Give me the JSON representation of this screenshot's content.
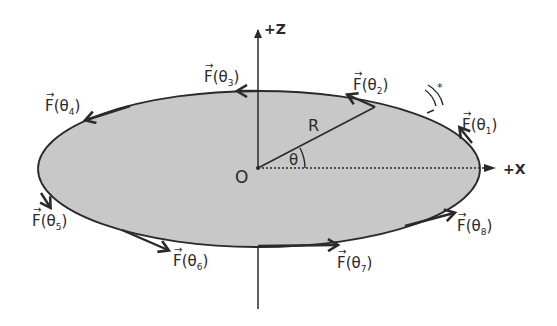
{
  "figure": {
    "colors": {
      "disk_fill": "#c8c8c8",
      "stroke": "#2a2a2a",
      "background": "#ffffff"
    },
    "axes": {
      "z_label": "+Z",
      "x_label": "+X"
    },
    "origin_label": "O",
    "radius_label": "R",
    "angle_label": "θ",
    "rotation_indicator": "ω",
    "force_labels": [
      {
        "id": "theta1",
        "vec": "F",
        "open": "(θ",
        "sub": "1",
        "close": ")"
      },
      {
        "id": "theta2",
        "vec": "F",
        "open": "(θ",
        "sub": "2",
        "close": ")"
      },
      {
        "id": "theta3",
        "vec": "F",
        "open": "(θ",
        "sub": "3",
        "close": ")"
      },
      {
        "id": "theta4",
        "vec": "F",
        "open": "(θ",
        "sub": "4",
        "close": ")"
      },
      {
        "id": "theta5",
        "vec": "F",
        "open": "(θ",
        "sub": "5",
        "close": ")"
      },
      {
        "id": "theta6",
        "vec": "F",
        "open": "(θ",
        "sub": "6",
        "close": ")"
      },
      {
        "id": "theta7",
        "vec": "F",
        "open": "(θ",
        "sub": "7",
        "close": ")"
      },
      {
        "id": "theta8",
        "vec": "F",
        "open": "(θ",
        "sub": "8",
        "close": ")"
      }
    ]
  }
}
